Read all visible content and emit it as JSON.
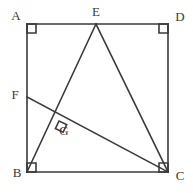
{
  "figure": {
    "background_color": "#ffffff",
    "stroke_color": "#3a3a3a",
    "label_color": "#3a3a3a",
    "stroke_width": 1.6,
    "canvas": {
      "width": 193,
      "height": 193
    },
    "points": [
      {
        "id": "A",
        "label": "A",
        "x": 27,
        "y": 24,
        "label_x": 16,
        "label_y": 17
      },
      {
        "id": "E",
        "label": "E",
        "x": 96,
        "y": 24,
        "label_x": 96,
        "label_y": 13
      },
      {
        "id": "D",
        "label": "D",
        "x": 168,
        "y": 24,
        "label_x": 180,
        "label_y": 18
      },
      {
        "id": "F",
        "label": "F",
        "x": 27,
        "y": 97,
        "label_x": 15,
        "label_y": 96
      },
      {
        "id": "G",
        "label": "G",
        "x": 59,
        "y": 121,
        "label_x": 64,
        "label_y": 132
      },
      {
        "id": "B",
        "label": "B",
        "x": 27,
        "y": 172,
        "label_x": 17,
        "label_y": 174
      },
      {
        "id": "C",
        "label": "C",
        "x": 168,
        "y": 172,
        "label_x": 180,
        "label_y": 177
      }
    ],
    "segments": [
      {
        "id": "AD",
        "name": "square-top-edge",
        "from": "A",
        "to": "D"
      },
      {
        "id": "DC",
        "name": "square-right-edge",
        "from": "D",
        "to": "C"
      },
      {
        "id": "CB",
        "name": "square-bottom-edge",
        "from": "C",
        "to": "B"
      },
      {
        "id": "BA",
        "name": "square-left-edge",
        "from": "B",
        "to": "A"
      },
      {
        "id": "BE",
        "name": "segment-be",
        "from": "B",
        "to": "E"
      },
      {
        "id": "EC",
        "name": "segment-ec",
        "from": "E",
        "to": "C"
      },
      {
        "id": "FC",
        "name": "segment-fc",
        "from": "F",
        "to": "C"
      }
    ],
    "right_angle_markers": [
      {
        "id": "angle-A",
        "at": "A",
        "size": 9,
        "rotation": 0,
        "note": "interior corner A of square"
      },
      {
        "id": "angle-D",
        "at": "D",
        "size": 9,
        "rotation": 90,
        "note": "interior corner D of square"
      },
      {
        "id": "angle-B",
        "at": "B",
        "size": 9,
        "rotation": 270,
        "note": "interior corner B of square"
      },
      {
        "id": "angle-C",
        "at": "C",
        "size": 9,
        "rotation": 180,
        "note": "interior corner C of square"
      },
      {
        "id": "angle-G",
        "at": "G",
        "size": 8.5,
        "rotation": 25,
        "note": "BE perpendicular to FC at G"
      }
    ]
  }
}
